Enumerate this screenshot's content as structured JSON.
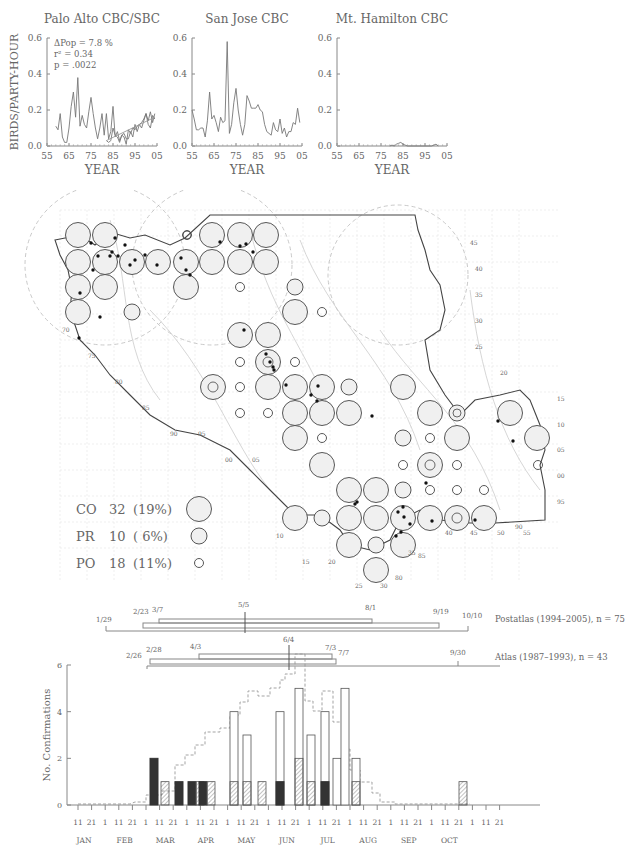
{
  "chart_data": [
    {
      "type": "line",
      "title": "Palo Alto CBC/SBC",
      "xlabel": "YEAR",
      "ylabel": "BIRDS/PARTY-HOUR",
      "ylim": [
        0,
        0.6
      ],
      "yticks": [
        "0.0",
        "0.2",
        "0.4",
        "0.6"
      ],
      "xticks": [
        "55",
        "65",
        "75",
        "85",
        "95",
        "05"
      ],
      "annotations": [
        "ΔPop =   7.8 %",
        "r² = 0.34",
        "p =  .0022"
      ],
      "series": [
        {
          "name": "CBC",
          "x": [
            59,
            60,
            61,
            62,
            63,
            64,
            65,
            66,
            67,
            68,
            69,
            70,
            71,
            72,
            73,
            74,
            75,
            76,
            77,
            78,
            79,
            80,
            81,
            82,
            83,
            84,
            85,
            86,
            87,
            88,
            89,
            90,
            91,
            92,
            93,
            94,
            95,
            96,
            97,
            98,
            99,
            100,
            101,
            102,
            103,
            104
          ],
          "y": [
            0.11,
            0.09,
            0.18,
            0.05,
            0.02,
            0.02,
            0.1,
            0.22,
            0.3,
            0.16,
            0.38,
            0.11,
            0.17,
            0.12,
            0.1,
            0.19,
            0.27,
            0.18,
            0.1,
            0.04,
            0.1,
            0.18,
            0.06,
            0.18,
            0.04,
            0.08,
            0.22,
            0.05,
            0.08,
            0.03,
            0.06,
            0.07,
            0.04,
            0.04,
            0.08,
            0.05,
            0.12,
            0.08,
            0.12,
            0.1,
            0.14,
            0.18,
            0.12,
            0.1,
            0.17,
            0.15
          ]
        },
        {
          "name": "SBC",
          "x": [
            82,
            83,
            84,
            85,
            86,
            87,
            88,
            89,
            90,
            91,
            92,
            93,
            94,
            95,
            96,
            97,
            98,
            99,
            100,
            101,
            102,
            103,
            104
          ],
          "y": [
            0.03,
            0.02,
            0.03,
            0.1,
            0.06,
            0.05,
            0.02,
            0.06,
            0.05,
            0.01,
            0.09,
            0.07,
            0.1,
            0.09,
            0.11,
            0.12,
            0.13,
            0.15,
            0.18,
            0.14,
            0.19,
            0.13,
            0.18
          ]
        },
        {
          "name": "trend",
          "x": [
            82,
            104
          ],
          "y": [
            0.03,
            0.16
          ]
        }
      ]
    },
    {
      "type": "line",
      "title": "San Jose CBC",
      "xlabel": "YEAR",
      "ylim": [
        0,
        0.6
      ],
      "yticks": [
        "0.0",
        "0.2",
        "0.4",
        "0.6"
      ],
      "xticks": [
        "55",
        "65",
        "75",
        "85",
        "95",
        "05"
      ],
      "series": [
        {
          "name": "CBC",
          "x": [
            55,
            56,
            57,
            58,
            59,
            60,
            61,
            62,
            63,
            64,
            65,
            66,
            67,
            68,
            69,
            70,
            71,
            72,
            73,
            74,
            75,
            76,
            77,
            78,
            79,
            80,
            81,
            82,
            83,
            84,
            85,
            86,
            87,
            88,
            89,
            90,
            91,
            92,
            93,
            94,
            95,
            96,
            97,
            98,
            99,
            100,
            101,
            102,
            103,
            104
          ],
          "y": [
            0.2,
            0.15,
            0.09,
            0.09,
            0.1,
            0.1,
            0.05,
            0.14,
            0.3,
            0.15,
            0.17,
            0.13,
            0.08,
            0.16,
            0.13,
            0.14,
            0.58,
            0.07,
            0.12,
            0.24,
            0.32,
            0.2,
            0.12,
            0.06,
            0.12,
            0.28,
            0.25,
            0.21,
            0.21,
            0.21,
            0.23,
            0.2,
            0.19,
            0.12,
            0.08,
            0.07,
            0.06,
            0.13,
            0.09,
            0.08,
            0.15,
            0.07,
            0.1,
            0.05,
            0.08,
            0.08,
            0.13,
            0.12,
            0.21,
            0.13
          ]
        }
      ]
    },
    {
      "type": "line",
      "title": "Mt. Hamilton CBC",
      "xlabel": "YEAR",
      "ylim": [
        0,
        0.6
      ],
      "yticks": [
        "0.0",
        "0.2",
        "0.4",
        "0.6"
      ],
      "xticks": [
        "55",
        "65",
        "75",
        "85",
        "95",
        "05"
      ],
      "series": [
        {
          "name": "CBC",
          "x": [
            79,
            80,
            81,
            82,
            83,
            84,
            85,
            86,
            87,
            98,
            99,
            100,
            101
          ],
          "y": [
            0,
            0.005,
            0,
            0.01,
            0.015,
            0.02,
            0.01,
            0.005,
            0,
            0,
            0.005,
            0.01,
            0
          ]
        }
      ]
    },
    {
      "type": "bar",
      "title": "Breeding phenology",
      "ylabel": "No. Confirmations",
      "ylim": [
        0,
        6
      ],
      "yticks": [
        "0",
        "2",
        "4",
        "6"
      ],
      "day_ticks": [
        "11",
        "21",
        "1",
        "11",
        "21",
        "1",
        "11",
        "21",
        "1",
        "11",
        "21",
        "1",
        "11",
        "21",
        "1",
        "11",
        "21",
        "1",
        "11",
        "21",
        "1",
        "11",
        "21",
        "1",
        "11",
        "21",
        "1",
        "11",
        "21",
        "1",
        "11",
        "21"
      ],
      "months": [
        "JAN",
        "FEB",
        "MAR",
        "APR",
        "MAY",
        "JUN",
        "JUL",
        "AUG",
        "SEP",
        "OCT"
      ],
      "bars": [
        {
          "period": "MAR 1",
          "dark": 2,
          "hatched": 0,
          "open": 0
        },
        {
          "period": "MAR 11",
          "dark": 0,
          "hatched": 1,
          "open": 0
        },
        {
          "period": "APR 1",
          "dark": 1,
          "hatched": 0,
          "open": 0
        },
        {
          "period": "APR 11",
          "dark": 1,
          "hatched": 1,
          "open": 0
        },
        {
          "period": "MAY 1",
          "dark": 1,
          "hatched": 1,
          "open": 0
        },
        {
          "period": "MAY 11",
          "dark": 0,
          "hatched": 1,
          "open": 3
        },
        {
          "period": "MAY 21",
          "dark": 0,
          "hatched": 1,
          "open": 2
        },
        {
          "period": "JUN 1",
          "dark": 0,
          "hatched": 1,
          "open": 0
        },
        {
          "period": "JUN 1b",
          "dark": 1,
          "hatched": 0,
          "open": 3
        },
        {
          "period": "JUN 11",
          "dark": 0,
          "hatched": 2,
          "open": 3
        },
        {
          "period": "JUN 21",
          "dark": 0,
          "hatched": 1,
          "open": 2
        },
        {
          "period": "JUL 1",
          "dark": 1,
          "hatched": 0,
          "open": 3
        },
        {
          "period": "JUL 1b",
          "dark": 0,
          "hatched": 0,
          "open": 2
        },
        {
          "period": "JUL 11",
          "dark": 0,
          "hatched": 0,
          "open": 5
        },
        {
          "period": "JUL 21",
          "dark": 0,
          "hatched": 1,
          "open": 1
        },
        {
          "period": "OCT 1",
          "dark": 0,
          "hatched": 1,
          "open": 0
        }
      ],
      "dashed_envelope": "cumulative effort curve (dashed)",
      "ranges": [
        {
          "label": "Postatlas (1994–2005), n = 75",
          "outer": [
            "1/29",
            "10/10"
          ],
          "inner": [
            "2/23",
            "9/19"
          ],
          "core": [
            "3/7",
            "8/1"
          ],
          "median": "5/5"
        },
        {
          "label": "Atlas (1987–1993), n = 43",
          "outer": [
            "2/26",
            "9/30"
          ],
          "inner": [
            "2/28",
            "7/7"
          ],
          "core": [
            "4/3",
            "7/3"
          ],
          "median": "6/4"
        }
      ]
    }
  ],
  "map": {
    "legend": [
      {
        "code": "CO",
        "count": "32",
        "pct": "(19%)",
        "size": "large"
      },
      {
        "code": "PR",
        "count": "10",
        "pct": "( 6%)",
        "size": "medium"
      },
      {
        "code": "PO",
        "count": "18",
        "pct": "(11%)",
        "size": "small"
      }
    ],
    "right_labels": [
      "45",
      "40",
      "35",
      "30",
      "25",
      "20",
      "15",
      "10",
      "05",
      "00",
      "95"
    ],
    "left_labels": [
      "70",
      "75",
      "80",
      "85",
      "90",
      "95",
      "00",
      "05"
    ],
    "bottom_labels": [
      "10",
      "15",
      "20",
      "25",
      "30",
      "35",
      "40",
      "45",
      "50",
      "55",
      "80",
      "85",
      "90"
    ]
  }
}
